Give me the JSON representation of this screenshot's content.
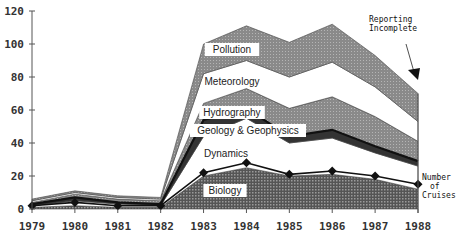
{
  "chart_data": {
    "type": "area",
    "stacked": true,
    "title": "",
    "xlabel": "",
    "ylabel": "",
    "x": [
      "1979",
      "1980",
      "1981",
      "1982",
      "1983",
      "1984",
      "1985",
      "1986",
      "1987",
      "1988"
    ],
    "ylim": [
      0,
      120
    ],
    "yticks": [
      0,
      20,
      40,
      60,
      80,
      100,
      120
    ],
    "grid": false,
    "series": [
      {
        "name": "Biology",
        "values": [
          1,
          2,
          1,
          1,
          20,
          25,
          20,
          21,
          18,
          12
        ]
      },
      {
        "name": "Dynamics",
        "values": [
          1,
          3,
          2,
          1,
          24,
          30,
          20,
          22,
          16,
          14
        ]
      },
      {
        "name": "Geology & Geophysics",
        "values": [
          1,
          2,
          1,
          1,
          10,
          6,
          4,
          5,
          4,
          3
        ]
      },
      {
        "name": "Hydrography",
        "values": [
          1,
          2,
          2,
          2,
          10,
          12,
          17,
          20,
          18,
          12
        ]
      },
      {
        "name": "Meteorology",
        "values": [
          1,
          1,
          1,
          1,
          18,
          17,
          19,
          21,
          18,
          12
        ]
      },
      {
        "name": "Pollution",
        "values": [
          1,
          1,
          1,
          1,
          18,
          21,
          21,
          23,
          19,
          17
        ]
      }
    ],
    "cruises": {
      "name": "Number of Cruises",
      "values": [
        2,
        4,
        2,
        2,
        22,
        28,
        21,
        23,
        20,
        15
      ]
    },
    "annotations": [
      {
        "text": "Reporting Incomplete",
        "points_to": "1988"
      },
      {
        "text": "Number of Cruises",
        "line": "cruises"
      }
    ]
  },
  "labels": {
    "yticks": [
      "0",
      "20",
      "40",
      "60",
      "80",
      "100",
      "120"
    ],
    "xticks": [
      "1979",
      "1980",
      "1981",
      "1982",
      "1983",
      "1984",
      "1985",
      "1986",
      "1987",
      "1988"
    ],
    "series": [
      "Biology",
      "Dynamics",
      "Geology & Geophysics",
      "Hydrography",
      "Meteorology",
      "Pollution"
    ],
    "reporting_line1": "Reporting",
    "reporting_line2": "Incomplete",
    "cruises_line1": "Number",
    "cruises_line2": "of",
    "cruises_line3": "Cruises"
  }
}
